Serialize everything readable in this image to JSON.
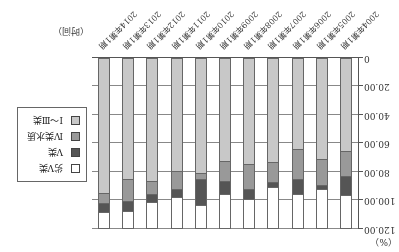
{
  "chart_data": {
    "type": "bar",
    "stacked": true,
    "title": "",
    "xlabel": "（时间）",
    "ylabel": "（%）",
    "ylim": [
      0,
      120
    ],
    "yticks": [
      "0",
      "20.00",
      "40.00",
      "60.00",
      "80.00",
      "100.00",
      "120.00"
    ],
    "grid": true,
    "legend_position": "right",
    "categories": [
      "2004年第1期",
      "2005年第1期",
      "2006年第1期",
      "2007年第1期",
      "2008年第1期",
      "2009年第1期",
      "2010年第1期",
      "2011年第1期",
      "2012年第1期",
      "2013年第1期",
      "2014年第1期"
    ],
    "series": [
      {
        "name": "Ⅰ～Ⅲ类",
        "color": "#c8c8c8",
        "values": [
          66,
          71.5,
          64.5,
          74,
          75,
          73,
          81.5,
          80,
          87,
          85.5,
          95.5
        ]
      },
      {
        "name": "Ⅳ类水质",
        "color": "#999999",
        "values": [
          17.5,
          18.5,
          21,
          14,
          17.5,
          14,
          4,
          12.5,
          9,
          15.5,
          7
        ]
      },
      {
        "name": "Ⅴ类",
        "color": "#555555",
        "values": [
          13.5,
          2.5,
          10.5,
          3,
          7,
          9,
          18.5,
          5.5,
          6,
          7,
          6.5
        ]
      },
      {
        "name": "劣Ⅴ类",
        "color": "#ffffff",
        "values": [
          23,
          27.5,
          24,
          29,
          20.5,
          24,
          16,
          22,
          18,
          12,
          11
        ]
      }
    ]
  }
}
